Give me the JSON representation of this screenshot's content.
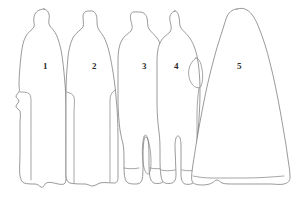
{
  "image": {
    "title": "Figure outline key",
    "type": "line-art-outline-diagram",
    "width": 302,
    "height": 213,
    "background_color": "#ffffff",
    "outline_color": "#6e6e72",
    "label_color": "#2b2b2b",
    "figure_count": 5
  },
  "figures": [
    {
      "number": "1",
      "label_x": 43,
      "label_y": 62,
      "description": "standing figure in long coat, facing left, hands at sides"
    },
    {
      "number": "2",
      "label_x": 92,
      "label_y": 62,
      "description": "standing figure in long coat with cap, arms down"
    },
    {
      "number": "3",
      "label_x": 142,
      "label_y": 62,
      "description": "standing figure with visible legs and boots"
    },
    {
      "number": "4",
      "label_x": 174,
      "label_y": 62,
      "description": "standing figure with cap, arm bent at hip, legs visible"
    },
    {
      "number": "5",
      "label_x": 237,
      "label_y": 62,
      "description": "large figure in full-length hooded robe or cloak"
    }
  ]
}
